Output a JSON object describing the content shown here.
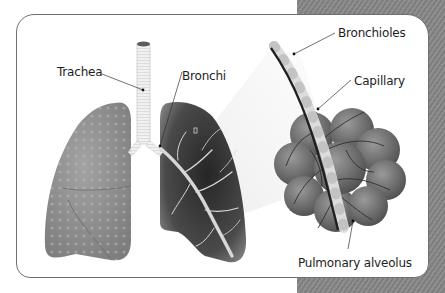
{
  "diagram": {
    "style": "grayscale",
    "labels": {
      "trachea": "Trachea",
      "bronchi": "Bronchi",
      "bronchioles": "Bronchioles",
      "capillary": "Capillary",
      "alveolus": "Pulmonary alveolus"
    },
    "parts": [
      {
        "id": "trachea",
        "label": "Trachea"
      },
      {
        "id": "bronchi",
        "label": "Bronchi"
      },
      {
        "id": "bronchioles",
        "label": "Bronchioles"
      },
      {
        "id": "capillary",
        "label": "Capillary"
      },
      {
        "id": "alveolus",
        "label": "Pulmonary alveolus"
      }
    ],
    "colors": {
      "background_pattern": "#8a8a8a",
      "card": "#ffffff",
      "card_border": "#6f6f6f",
      "left_lung": "#8c8c8c",
      "right_lung": "#3a3a3a",
      "alveoli": "#6e6e6e",
      "text": "#1e1e1e"
    }
  }
}
